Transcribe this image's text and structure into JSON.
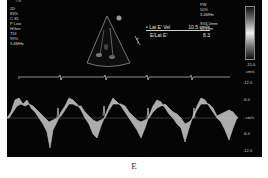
{
  "header": {
    "top_label": "TIB"
  },
  "left_params": [
    "2D",
    "83%",
    "C 35",
    "P Low",
    "HGen",
    "TDI",
    "99%",
    "3.4MHz"
  ],
  "right_params": [
    "PW",
    "50%",
    "3.4MHz",
    "",
    "SV4.0mm",
    "12.2cm"
  ],
  "measurements": {
    "row1": {
      "label": "• Lat E' Vel",
      "value": "10.5 cm/s"
    },
    "row2": {
      "label": "E/Lat E'",
      "value": "8.3"
    }
  },
  "velocity_scale": {
    "gray_bar_min": "-15.0",
    "gray_bar_unit": "cm/s",
    "ticks": [
      "-12.0",
      "-6.0",
      "- cm/s",
      "-6.0",
      "-12.0"
    ]
  },
  "colors": {
    "background": "#050505",
    "text": "#d8d8d8",
    "signal": "#cfcfcf"
  },
  "caption": "E"
}
